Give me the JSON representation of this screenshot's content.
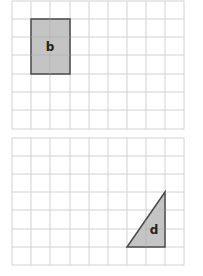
{
  "colors": {
    "grid_line": "#d2d2d2",
    "shape_fill": "#c4c4c4",
    "shape_stroke": "#4a4a4a",
    "label": "#222222"
  },
  "grids": [
    {
      "name": "top-grid",
      "columns": 9,
      "rows": 7,
      "shape": {
        "type": "rectangle",
        "label": "b",
        "cells": {
          "col_start": 1,
          "row_start": 1,
          "col_span": 2,
          "row_span": 3
        }
      }
    },
    {
      "name": "bottom-grid",
      "columns": 9,
      "rows": 7,
      "shape": {
        "type": "right-triangle",
        "label": "d",
        "cells": {
          "col_start": 6,
          "row_start": 3,
          "col_span": 2,
          "row_span": 3
        }
      }
    }
  ]
}
